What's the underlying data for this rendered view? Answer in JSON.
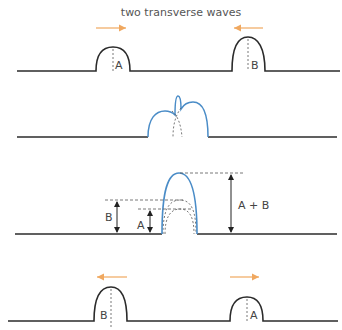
{
  "title": "two transverse waves",
  "colors": {
    "string": "#2b2b2b",
    "superposition": "#4a8cc7",
    "arrow": "#f0a860",
    "dashed": "#555555",
    "text": "#444444"
  },
  "panels": [
    {
      "id": "before",
      "pulses": [
        {
          "label": "A",
          "direction": "right"
        },
        {
          "label": "B",
          "direction": "left"
        }
      ]
    },
    {
      "id": "overlapping",
      "description": "pulses begin to overlap"
    },
    {
      "id": "superposition",
      "labels": {
        "b": "B",
        "a": "A",
        "sum": "A + B"
      }
    },
    {
      "id": "after",
      "pulses": [
        {
          "label": "B",
          "direction": "left"
        },
        {
          "label": "A",
          "direction": "right"
        }
      ]
    }
  ]
}
